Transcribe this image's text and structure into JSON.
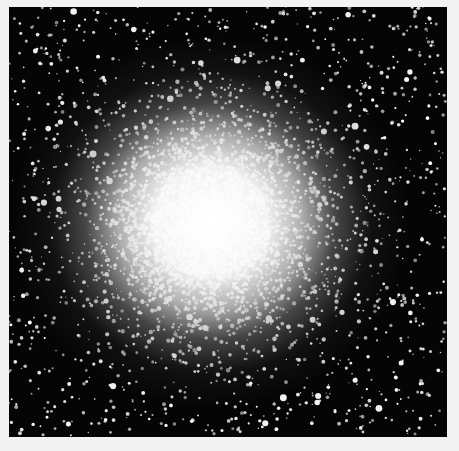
{
  "image": {
    "subject": "globular star cluster",
    "style": "black-and-white astronomical photograph",
    "frame": {
      "background_color": "#f3f3f3",
      "photo_left": 9,
      "photo_top": 7,
      "photo_width": 438,
      "photo_height": 430,
      "photo_background": "#050505"
    },
    "cluster": {
      "center_x": 201,
      "center_y": 218,
      "core_radius": 110,
      "halo_radius": 260,
      "star_count": 4200,
      "seed": 7
    }
  }
}
